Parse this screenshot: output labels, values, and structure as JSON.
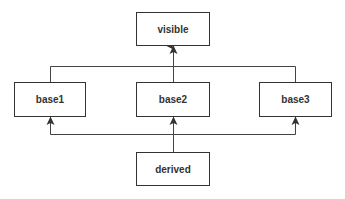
{
  "diagram": {
    "nodes": {
      "visible": {
        "label": "visible"
      },
      "base1": {
        "label": "base1"
      },
      "base2": {
        "label": "base2"
      },
      "base3": {
        "label": "base3"
      },
      "derived": {
        "label": "derived"
      }
    },
    "edges": [
      {
        "from": "base1",
        "to": "visible"
      },
      {
        "from": "base2",
        "to": "visible"
      },
      {
        "from": "base3",
        "to": "visible"
      },
      {
        "from": "derived",
        "to": "base1"
      },
      {
        "from": "derived",
        "to": "base2"
      },
      {
        "from": "derived",
        "to": "base3"
      }
    ],
    "colors": {
      "line": "#333333",
      "box_border": "#333333",
      "text": "#333333"
    }
  }
}
